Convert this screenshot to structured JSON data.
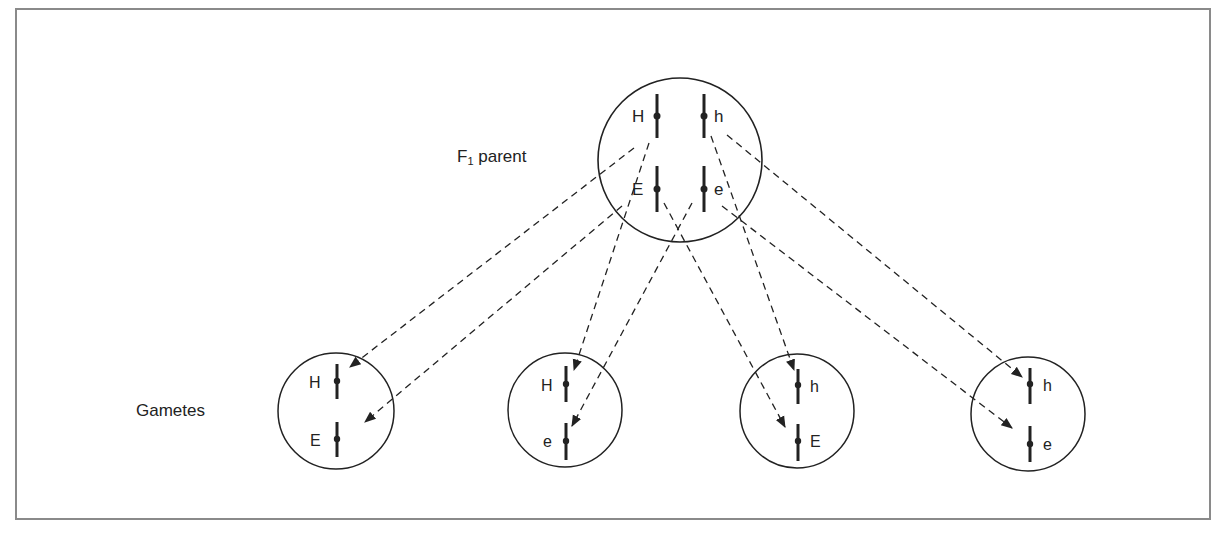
{
  "diagram": {
    "parent_label": "F",
    "parent_label_subscript": "1",
    "parent_label_suffix": " parent",
    "gametes_label": "Gametes",
    "colors": {
      "line": "#222222",
      "border": "#8a8a8a",
      "background": "#ffffff"
    },
    "parent": {
      "alleles": [
        {
          "label": "H",
          "gene": "upper-left"
        },
        {
          "label": "h",
          "gene": "upper-right"
        },
        {
          "label": "E",
          "gene": "lower-left"
        },
        {
          "label": "e",
          "gene": "lower-right"
        }
      ]
    },
    "gametes": [
      {
        "id": 1,
        "top": "H",
        "bottom": "E",
        "label_side": "left"
      },
      {
        "id": 2,
        "top": "H",
        "bottom": "e",
        "label_side": "left"
      },
      {
        "id": 3,
        "top": "h",
        "bottom": "E",
        "label_side": "right"
      },
      {
        "id": 4,
        "top": "h",
        "bottom": "e",
        "label_side": "right"
      }
    ]
  }
}
